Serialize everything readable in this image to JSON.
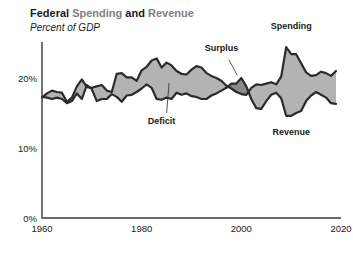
{
  "chart_data": {
    "type": "area",
    "title_parts": [
      "Federal ",
      "Spending",
      " and ",
      "Revenue"
    ],
    "title": "Federal Spending and Revenue",
    "subtitle": "Percent of GDP",
    "xlabel": "",
    "ylabel": "Percent of GDP",
    "xlim": [
      1960,
      2020
    ],
    "ylim": [
      0,
      26
    ],
    "yticks": [
      0,
      10,
      20
    ],
    "yticklabels": [
      "0%",
      "10%",
      "20%"
    ],
    "xticks": [
      1960,
      1980,
      2000,
      2020
    ],
    "xticklabels": [
      "1960",
      "1980",
      "2000",
      "2020"
    ],
    "grid": false,
    "legend_position": "inline-annotations",
    "annotations": [
      {
        "label": "Spending",
        "x": 2010,
        "y": 27.0
      },
      {
        "label": "Revenue",
        "x": 2010,
        "y": 11.9
      },
      {
        "label": "Surplus",
        "x": 1996,
        "y": 23.8
      },
      {
        "label": "Deficit",
        "x": 1984,
        "y": 13.5
      }
    ],
    "colors": {
      "deficit_fill": "#b3b3b3",
      "surplus_fill": "#8a8a8a",
      "line": "#2b2b2b",
      "axis": "#3a3a3a",
      "title_accent": "#808080",
      "text": "#1a1a1a"
    },
    "x": [
      1960,
      1961,
      1962,
      1963,
      1964,
      1965,
      1966,
      1967,
      1968,
      1969,
      1970,
      1971,
      1972,
      1973,
      1974,
      1975,
      1976,
      1977,
      1978,
      1979,
      1980,
      1981,
      1982,
      1983,
      1984,
      1985,
      1986,
      1987,
      1988,
      1989,
      1990,
      1991,
      1992,
      1993,
      1994,
      1995,
      1996,
      1997,
      1998,
      1999,
      2000,
      2001,
      2002,
      2003,
      2004,
      2005,
      2006,
      2007,
      2008,
      2009,
      2010,
      2011,
      2012,
      2013,
      2014,
      2015,
      2016,
      2017,
      2018,
      2019
    ],
    "series": [
      {
        "name": "Spending",
        "values": [
          17.2,
          17.8,
          18.2,
          18.0,
          17.9,
          16.6,
          17.2,
          18.8,
          19.8,
          18.7,
          18.6,
          18.8,
          19.0,
          18.2,
          18.0,
          20.6,
          20.7,
          20.1,
          20.1,
          19.6,
          21.1,
          21.6,
          22.5,
          22.8,
          21.5,
          22.2,
          21.8,
          21.0,
          20.6,
          20.5,
          21.2,
          21.7,
          21.5,
          20.7,
          20.3,
          20.0,
          19.6,
          18.9,
          18.5,
          18.0,
          17.7,
          17.6,
          18.6,
          19.1,
          19.0,
          19.2,
          19.4,
          19.1,
          20.2,
          24.4,
          23.4,
          23.4,
          22.1,
          20.8,
          20.3,
          20.4,
          20.9,
          20.7,
          20.3,
          21.0
        ]
      },
      {
        "name": "Revenue",
        "values": [
          17.3,
          17.2,
          17.0,
          17.2,
          17.0,
          16.4,
          16.7,
          17.8,
          17.0,
          19.0,
          18.4,
          16.7,
          17.0,
          17.0,
          17.7,
          17.3,
          16.6,
          17.5,
          17.6,
          18.0,
          18.5,
          19.1,
          18.6,
          17.0,
          16.9,
          17.2,
          17.0,
          17.9,
          17.6,
          17.8,
          17.4,
          17.3,
          17.0,
          17.0,
          17.5,
          17.8,
          18.2,
          18.6,
          19.2,
          19.2,
          20.0,
          18.8,
          17.0,
          15.7,
          15.6,
          16.7,
          17.6,
          17.9,
          17.1,
          14.6,
          14.6,
          15.0,
          15.3,
          16.7,
          17.5,
          18.0,
          17.6,
          17.2,
          16.4,
          16.3
        ]
      }
    ]
  }
}
